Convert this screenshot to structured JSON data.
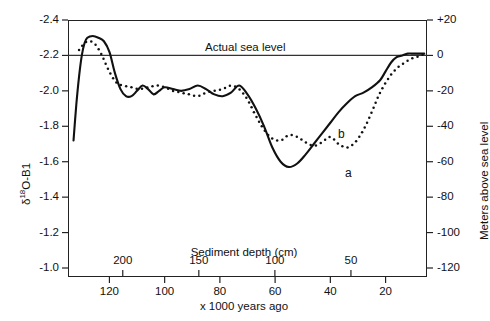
{
  "figure": {
    "sea_level_annotation": "Actual sea level",
    "curve_a_label": "a",
    "curve_b_label": "b"
  },
  "axes": {
    "left": {
      "title_delta": "δ",
      "title_sup": "18",
      "title_rest": "O-B1",
      "ticks": [
        "-2.4",
        "-2.2",
        "-2.0",
        "-1.8",
        "-1.6",
        "-1.4",
        "-1.2",
        "-1.0"
      ]
    },
    "right": {
      "title": "Meters above sea level",
      "ticks": [
        "+20",
        "0",
        "-20",
        "-40",
        "-60",
        "-80",
        "-100",
        "-120"
      ]
    },
    "bottom_upper": {
      "title": "Sediment depth (cm)",
      "ticks": [
        "200",
        "150",
        "100",
        "50"
      ]
    },
    "bottom_lower": {
      "title": "x 1000 years ago",
      "ticks": [
        "120",
        "100",
        "80",
        "60",
        "40",
        "20"
      ]
    }
  },
  "chart_data": {
    "type": "line",
    "title": "",
    "xlabel": "x 1000 years ago",
    "ylabel": "δ18O-B1",
    "y2label": "Meters above sea level",
    "xlim": [
      135,
      5
    ],
    "ylim": [
      -1.0,
      -2.4
    ],
    "y2lim": [
      -130,
      20
    ],
    "grid": false,
    "legend": "inline-labels",
    "annotations": [
      {
        "text": "Actual sea level",
        "y_delta18O": -2.2,
        "y_meters": 0
      },
      {
        "text": "a",
        "series": "a",
        "x": 55,
        "y_delta18O": -1.57
      },
      {
        "text": "b",
        "series": "b",
        "x": 45,
        "y_delta18O": -1.7
      }
    ],
    "sea_level_line": {
      "y_delta18O": -2.2,
      "y_meters": 0
    },
    "secondary_x_axis": {
      "label": "Sediment depth (cm)",
      "ticks": [
        200,
        150,
        100,
        50
      ]
    },
    "series": [
      {
        "name": "a",
        "style": "solid",
        "description": "Reconstructed sea level (solid curve)",
        "x": [
          133,
          132,
          131,
          130,
          129,
          128,
          126,
          124,
          122,
          120,
          118,
          116,
          114,
          112,
          110,
          108,
          106,
          104,
          102,
          100,
          97,
          94,
          91,
          88,
          85,
          82,
          79,
          76,
          73,
          70,
          67,
          64,
          61,
          58,
          55,
          52,
          49,
          46,
          43,
          40,
          37,
          34,
          31,
          28,
          25,
          22,
          20,
          18,
          16,
          14,
          12,
          10,
          9,
          8,
          7,
          6
        ],
        "y_delta18O": [
          -1.72,
          -1.92,
          -2.08,
          -2.2,
          -2.27,
          -2.3,
          -2.31,
          -2.3,
          -2.28,
          -2.22,
          -2.1,
          -2.01,
          -1.97,
          -1.97,
          -2.0,
          -2.03,
          -2.01,
          -1.98,
          -2.0,
          -2.02,
          -2.01,
          -2.0,
          -2.01,
          -2.03,
          -2.01,
          -1.98,
          -1.97,
          -1.99,
          -2.03,
          -1.98,
          -1.9,
          -1.8,
          -1.68,
          -1.6,
          -1.57,
          -1.59,
          -1.64,
          -1.7,
          -1.76,
          -1.82,
          -1.88,
          -1.93,
          -1.97,
          -1.99,
          -2.02,
          -2.06,
          -2.11,
          -2.16,
          -2.19,
          -2.2,
          -2.21,
          -2.21,
          -2.21,
          -2.21,
          -2.21,
          -2.21
        ],
        "y_meters": [
          -82,
          -61,
          -44,
          -31,
          -24,
          -21,
          -20,
          -21,
          -23,
          -29,
          -42,
          -52,
          -56,
          -56,
          -53,
          -50,
          -52,
          -55,
          -53,
          -51,
          -52,
          -53,
          -52,
          -50,
          -52,
          -55,
          -56,
          -54,
          -50,
          -55,
          -63,
          -74,
          -87,
          -95,
          -98,
          -96,
          -91,
          -85,
          -78,
          -72,
          -65,
          -60,
          -56,
          -54,
          -51,
          -47,
          -42,
          -37,
          -34,
          -33,
          -32,
          -32,
          -32,
          -32,
          -32,
          -32
        ]
      },
      {
        "name": "b",
        "style": "dotted",
        "description": "Model / comparison sea level (dotted curve)",
        "x": [
          131,
          129,
          127,
          125,
          123,
          121,
          119,
          117,
          115,
          112,
          109,
          106,
          103,
          100,
          97,
          94,
          91,
          88,
          85,
          82,
          79,
          76,
          73,
          70,
          67,
          64,
          61,
          58,
          55,
          52,
          49,
          46,
          43,
          40,
          37,
          34,
          31,
          28,
          25,
          22,
          19,
          17,
          15,
          13,
          11,
          9,
          7,
          6
        ],
        "y_delta18O": [
          -2.23,
          -2.27,
          -2.28,
          -2.26,
          -2.21,
          -2.14,
          -2.08,
          -2.04,
          -2.03,
          -2.02,
          -2.01,
          -2.02,
          -2.03,
          -2.02,
          -2.0,
          -1.99,
          -1.98,
          -1.97,
          -1.99,
          -2.0,
          -2.01,
          -2.03,
          -2.01,
          -1.95,
          -1.86,
          -1.78,
          -1.73,
          -1.72,
          -1.75,
          -1.74,
          -1.71,
          -1.69,
          -1.71,
          -1.74,
          -1.7,
          -1.68,
          -1.71,
          -1.78,
          -1.88,
          -1.99,
          -2.07,
          -2.11,
          -2.14,
          -2.16,
          -2.18,
          -2.19,
          -2.2,
          -2.21
        ],
        "y_meters": [
          -28,
          -24,
          -23,
          -25,
          -30,
          -37,
          -44,
          -49,
          -50,
          -51,
          -52,
          -51,
          -50,
          -51,
          -53,
          -54,
          -55,
          -56,
          -54,
          -53,
          -52,
          -50,
          -52,
          -58,
          -67,
          -76,
          -81,
          -82,
          -79,
          -80,
          -83,
          -85,
          -83,
          -80,
          -84,
          -86,
          -83,
          -76,
          -65,
          -54,
          -46,
          -42,
          -39,
          -37,
          -35,
          -34,
          -33,
          -32
        ]
      }
    ]
  }
}
